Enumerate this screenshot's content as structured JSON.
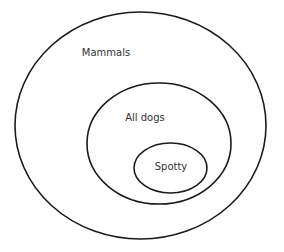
{
  "diagram": {
    "type": "nested-venn",
    "sets": [
      {
        "label": "Mammals",
        "cx": 140.5,
        "cy": 125.5,
        "rx": 125.5,
        "ry": 113.5,
        "label_x": 106,
        "label_y": 52
      },
      {
        "label": "All dogs",
        "cx": 159,
        "cy": 143.5,
        "rx": 72,
        "ry": 60.5,
        "label_x": 145,
        "label_y": 117
      },
      {
        "label": "Spotty",
        "cx": 170.5,
        "cy": 168,
        "rx": 36.5,
        "ry": 25,
        "label_x": 171,
        "label_y": 166
      }
    ],
    "stroke_color": "#1a1a1a",
    "text_color": "#333333"
  }
}
